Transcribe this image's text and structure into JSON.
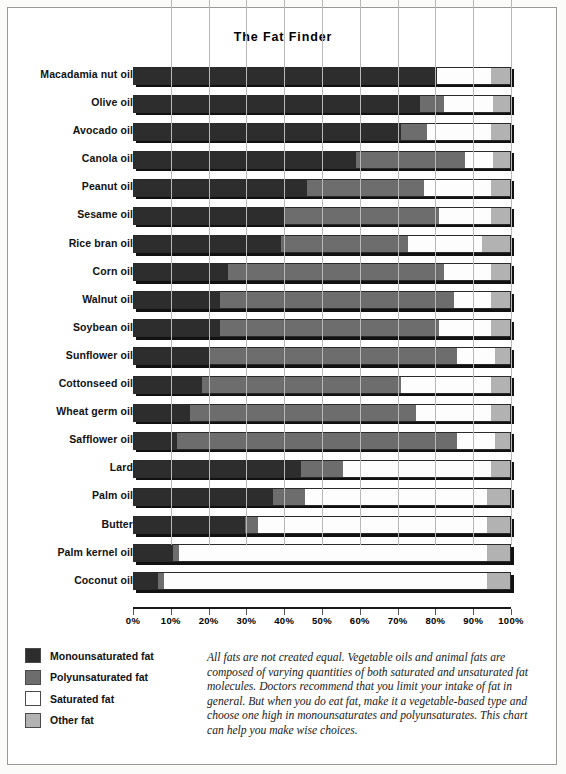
{
  "page": {
    "title": "The Fat Finder"
  },
  "legend": {
    "items": [
      {
        "key": "mono",
        "label": "Monounsaturated fat",
        "color": "#2d2d2d"
      },
      {
        "key": "poly",
        "label": "Polyunsaturated fat",
        "color": "#6d6d6d"
      },
      {
        "key": "sat",
        "label": "Saturated fat",
        "color": "#ffffff"
      },
      {
        "key": "other",
        "label": "Other fat",
        "color": "#b2b2b2"
      }
    ]
  },
  "caption": {
    "text": "All fats are not created equal. Vegetable oils and animal fats are composed of varying quantities of both saturated and unsaturated fat molecules. Doctors recommend that you limit your intake of fat in general. But when you do eat fat, make it a vegetable-based type and choose one high in monounsaturates and polyunsaturates. This chart can help you make wise choices."
  },
  "chart_data": {
    "type": "bar",
    "orientation": "horizontal",
    "stacked": true,
    "stack_total": 100,
    "title": "The Fat Finder",
    "xlabel": "",
    "ylabel": "",
    "xlim": [
      0,
      100
    ],
    "xunit": "%",
    "grid": true,
    "legend_position": "bottom-left",
    "xticks": [
      0,
      10,
      20,
      30,
      40,
      50,
      60,
      70,
      80,
      90,
      100
    ],
    "xticklabels": [
      "0%",
      "10%",
      "20%",
      "30%",
      "40%",
      "50%",
      "60%",
      "70%",
      "80%",
      "90%",
      "100%"
    ],
    "categories": [
      "Macadamia nut oil",
      "Olive oil",
      "Avocado oil",
      "Canola oil",
      "Peanut oil",
      "Sesame oil",
      "Rice bran oil",
      "Corn oil",
      "Walnut oil",
      "Soybean oil",
      "Sunflower oil",
      "Cottonseed oil",
      "Wheat germ oil",
      "Safflower oil",
      "Lard",
      "Palm oil",
      "Butter",
      "Palm kernel oil",
      "Coconut oil"
    ],
    "series": [
      {
        "name": "Monounsaturated fat",
        "color": "#2d2d2d",
        "values": [
          80.5,
          76,
          71,
          59,
          46,
          40,
          39,
          25,
          23,
          23,
          20,
          18,
          15,
          11.5,
          44.5,
          37,
          29.5,
          10.5,
          6.5
        ]
      },
      {
        "name": "Polyunsaturated fat",
        "color": "#6d6d6d",
        "values": [
          0,
          6.5,
          7,
          29,
          31,
          41,
          34,
          57.5,
          62,
          58,
          66,
          53,
          60,
          74.5,
          11,
          8.5,
          3.5,
          1.5,
          1.5
        ]
      },
      {
        "name": "Saturated fat",
        "color": "#ffffff",
        "values": [
          14.5,
          13,
          17,
          7.5,
          18,
          14,
          19.5,
          12.5,
          10,
          14,
          10,
          24,
          20,
          10,
          39.5,
          48.5,
          61,
          82,
          86
        ]
      },
      {
        "name": "Other fat",
        "color": "#b2b2b2",
        "values": [
          5,
          4.5,
          5,
          4.5,
          5,
          5,
          7.5,
          5,
          5,
          5,
          4,
          5,
          5,
          4,
          5,
          6,
          6,
          6,
          6
        ]
      }
    ]
  }
}
